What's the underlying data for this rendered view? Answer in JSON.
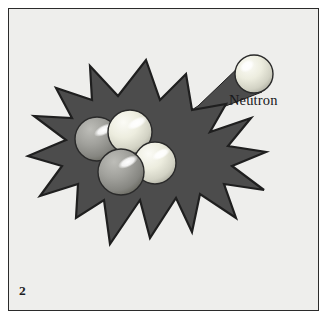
{
  "figure": {
    "number": "2",
    "caption_label": "Neutron",
    "alt_description": "A neutron strikes a nucleus causing a fission explosion",
    "background_color": "#eeeeec",
    "frame_border_color": "#2b2b2b",
    "burst_color": "#4c4c4c",
    "burst_outline_color": "#232323",
    "page_color": "#ffffff"
  },
  "labels": {
    "neutron": "Neutron",
    "figure_number": "2"
  },
  "burst": {
    "name": "explosion-starburst",
    "fill": "#4c4c4c",
    "stroke": "#1f1f1f",
    "points": "146,60 160,100 186,74 192,110 226,104 210,132 251,118 228,146 266,152 232,166 264,190 224,184 236,218 200,194 192,232 176,198 150,238 140,200 110,244 104,200 76,218 78,184 40,196 62,166 28,156 66,140 34,116 72,118 56,88 92,100 90,66 118,96"
  },
  "neutron_trail": {
    "name": "neutron-trail",
    "fill": "#4c4c4c",
    "points": "244,62 262,92 158,132 198,106"
  },
  "spheres": [
    {
      "name": "neutron-sphere",
      "cx": 254,
      "cy": 74,
      "r": 19,
      "tone": "light",
      "base": "#f4f4ef",
      "mid": "#e2e2d8",
      "edge": "#b8b8ad",
      "stroke": "#2a2a2a",
      "highlight_cx": 247,
      "highlight_cy": 66,
      "highlight_rx": 8,
      "highlight_ry": 5.5,
      "highlight_rot": -35
    },
    {
      "name": "proton-sphere-left",
      "cx": 97,
      "cy": 139,
      "r": 22,
      "tone": "gray",
      "base": "#a9a9a4",
      "mid": "#90908b",
      "edge": "#6e6e69",
      "stroke": "#2a2a2a",
      "highlight_cx": 104,
      "highlight_cy": 130,
      "highlight_rx": 11,
      "highlight_ry": 5,
      "highlight_rot": -28
    },
    {
      "name": "neutron-sphere-top",
      "cx": 130,
      "cy": 132,
      "r": 22,
      "tone": "light",
      "base": "#f1f1e9",
      "mid": "#dedecf",
      "edge": "#b4b4a6",
      "stroke": "#2a2a2a",
      "highlight_cx": 137,
      "highlight_cy": 123,
      "highlight_rx": 11,
      "highlight_ry": 5,
      "highlight_rot": -28
    },
    {
      "name": "neutron-sphere-right",
      "cx": 155,
      "cy": 163,
      "r": 21,
      "tone": "light",
      "base": "#f1f1e9",
      "mid": "#dedecf",
      "edge": "#b4b4a6",
      "stroke": "#2a2a2a",
      "highlight_cx": 161,
      "highlight_cy": 154,
      "highlight_rx": 10,
      "highlight_ry": 4.6,
      "highlight_rot": -28
    },
    {
      "name": "proton-sphere-bottom",
      "cx": 121,
      "cy": 172,
      "r": 23,
      "tone": "gray",
      "base": "#a9a9a4",
      "mid": "#90908b",
      "edge": "#6e6e69",
      "stroke": "#2a2a2a",
      "highlight_cx": 128,
      "highlight_cy": 162,
      "highlight_rx": 11,
      "highlight_ry": 5,
      "highlight_rot": -28
    }
  ]
}
